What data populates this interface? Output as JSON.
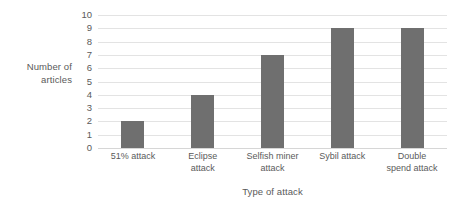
{
  "chart_data": {
    "type": "bar",
    "title": "",
    "categories": [
      "51% attack",
      "Eclipse attack",
      "Selfish miner attack",
      "Sybil attack",
      "Double spend attack"
    ],
    "category_label_lines": [
      [
        "51% attack"
      ],
      [
        "Eclipse",
        "attack"
      ],
      [
        "Selfish miner",
        "attack"
      ],
      [
        "Sybil attack"
      ],
      [
        "Double",
        "spend attack"
      ]
    ],
    "values": [
      2,
      4,
      7,
      9,
      9
    ],
    "xlabel": "Type of attack",
    "ylabel": "Number of articles",
    "ylabel_lines": [
      "Number of",
      "articles"
    ],
    "ylim": [
      0,
      10
    ],
    "ytick_labels": [
      "10",
      "9",
      "8",
      "7",
      "6",
      "5",
      "4",
      "3",
      "2",
      "1",
      "0"
    ],
    "ytick_values": [
      10,
      9,
      8,
      7,
      6,
      5,
      4,
      3,
      2,
      1,
      0
    ],
    "grid": true,
    "legend": false,
    "legend_position": "none",
    "bar_color": "#6f6f6f",
    "gridline_color": "#e3e3e3",
    "text_color": "#5a5a5a",
    "background_color": "#ffffff"
  }
}
